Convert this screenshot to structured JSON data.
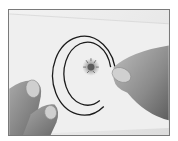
{
  "image": {
    "subject": "fingers holding a glass microscope slide with a circled specimen",
    "style": "grayscale photograph",
    "colors": {
      "background": "#ffffff",
      "frame_border": "#7a7a7a",
      "slide": "#ececec",
      "circle_marks": "#1a1a1a",
      "specimen": "#6e6e6e",
      "skin": "#8c8c8c",
      "nail": "#c8c8c8"
    }
  }
}
